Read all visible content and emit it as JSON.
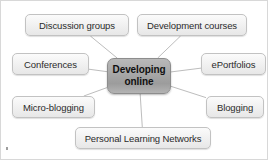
{
  "diagram": {
    "title": "Developing online",
    "type": "hub-and-spoke mind map",
    "background_color": "#ffffff",
    "hub": {
      "label_line1": "Developing",
      "label_line2": "online",
      "fill_color": "#a9a9a9",
      "border_color": "#8d8d8d",
      "text_color": "#101010"
    },
    "node_style": {
      "fill_color": "#f2f2f2",
      "border_color": "#c2c2c2",
      "text_color": "#2b2b2b"
    },
    "connector_color": "#bdbdbd",
    "nodes": [
      {
        "id": "discussion-groups",
        "label": "Discussion groups",
        "x": 24,
        "y": 13,
        "w": 104,
        "h": 22
      },
      {
        "id": "development-courses",
        "label": "Development courses",
        "x": 136,
        "y": 13,
        "w": 110,
        "h": 22
      },
      {
        "id": "conferences",
        "label": "Conferences",
        "x": 11,
        "y": 52,
        "w": 77,
        "h": 22
      },
      {
        "id": "eportfolios",
        "label": "ePortfolios",
        "x": 200,
        "y": 52,
        "w": 65,
        "h": 22
      },
      {
        "id": "micro-blogging",
        "label": "Micro-blogging",
        "x": 11,
        "y": 95,
        "w": 83,
        "h": 22
      },
      {
        "id": "blogging",
        "label": "Blogging",
        "x": 205,
        "y": 95,
        "w": 58,
        "h": 22
      },
      {
        "id": "personal-learning-networks",
        "label": "Personal Learning Networks",
        "x": 74,
        "y": 126,
        "w": 136,
        "h": 22
      }
    ],
    "hub_box": {
      "x": 106,
      "y": 57,
      "w": 64,
      "h": 36
    },
    "edges": [
      {
        "from": "hub",
        "to": "discussion-groups"
      },
      {
        "from": "hub",
        "to": "development-courses"
      },
      {
        "from": "hub",
        "to": "conferences"
      },
      {
        "from": "hub",
        "to": "eportfolios"
      },
      {
        "from": "hub",
        "to": "micro-blogging"
      },
      {
        "from": "hub",
        "to": "blogging"
      },
      {
        "from": "hub",
        "to": "personal-learning-networks"
      }
    ]
  }
}
